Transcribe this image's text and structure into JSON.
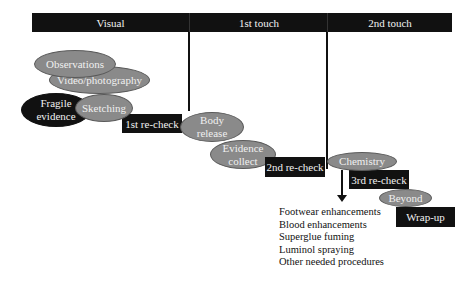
{
  "header": {
    "phases": [
      {
        "label": "Visual"
      },
      {
        "label": "1st touch"
      },
      {
        "label": "2nd touch"
      }
    ]
  },
  "visual_phase": {
    "observations": "Observations",
    "video": "Video/photography",
    "fragile_line1": "Fragile",
    "fragile_line2": "evidence",
    "sketching": "Sketching"
  },
  "first_touch": {
    "recheck": "1st re-check",
    "body_line1": "Body",
    "body_line2": "release",
    "evidence_line1": "Evidence",
    "evidence_line2": "collect",
    "recheck2": "2nd re-check"
  },
  "second_touch": {
    "chemistry": "Chemistry",
    "recheck3": "3rd re-check",
    "beyond": "Beyond",
    "wrapup": "Wrap-up"
  },
  "procedures": [
    "Footwear enhancements",
    "Blood enhancements",
    "Superglue fuming",
    "Luminol spraying",
    "Other needed procedures"
  ],
  "colors": {
    "bar": "#111111",
    "ellipse": "#8a8a8a",
    "dark_ellipse": "#111111"
  }
}
